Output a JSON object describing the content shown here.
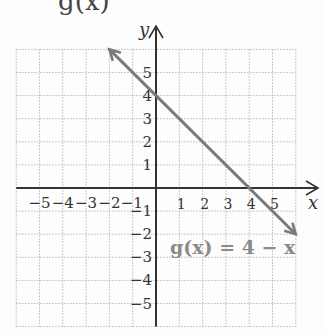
{
  "header": {
    "clipped_title_fragment": "g(x)"
  },
  "chart_data": {
    "type": "line",
    "title": "",
    "xlabel": "x",
    "ylabel": "y",
    "xlim": [
      -6,
      6
    ],
    "ylim": [
      -6,
      6
    ],
    "grid": true,
    "x_ticks": [
      -5,
      -4,
      -3,
      -2,
      -1,
      1,
      2,
      3,
      4,
      5
    ],
    "y_ticks": [
      -5,
      -4,
      -3,
      -2,
      -1,
      1,
      2,
      3,
      4,
      5
    ],
    "series": [
      {
        "name": "g(x) = 4 − x",
        "x": [
          -2,
          6
        ],
        "y": [
          6,
          -2
        ],
        "color": "#7a7a7a",
        "arrows": "both"
      }
    ],
    "annotations": [
      {
        "text": "g(x) = 4 − x",
        "x": 0.6,
        "y": -2.6
      }
    ]
  }
}
